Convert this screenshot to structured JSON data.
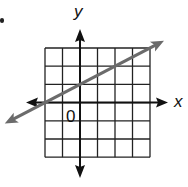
{
  "chart_data": {
    "type": "line",
    "title": "",
    "xlabel": "x",
    "ylabel": "y",
    "origin_label": "0",
    "grid": true,
    "xlim": [
      -2,
      4
    ],
    "ylim": [
      -3,
      3
    ],
    "tick_labels": [],
    "series": [
      {
        "name": "line",
        "equation": "y = 0.5x + 1",
        "slope": 0.5,
        "y_intercept": 1,
        "x": [
          -2,
          0,
          2,
          4
        ],
        "y": [
          0,
          1,
          2,
          3
        ],
        "color": "#6b6b6b",
        "arrows": "both"
      }
    ],
    "axis_color": "#111111",
    "grid_color": "#222222"
  },
  "labels": {
    "x_axis": "x",
    "y_axis": "y",
    "origin": "0"
  }
}
